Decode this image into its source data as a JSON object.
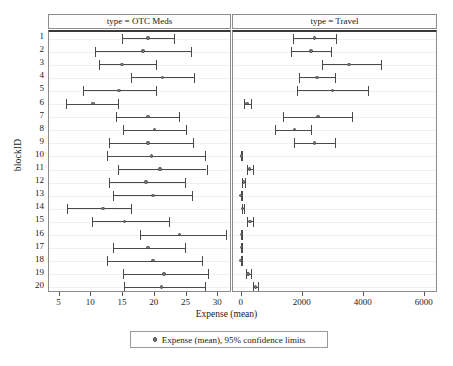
{
  "chart_data": {
    "type": "scatter",
    "title": "",
    "xlabel": "Expense (mean)",
    "ylabel": "blockID",
    "grid": true,
    "legend_position": "bottom",
    "legend_entries": [
      "Expense (mean), 95% confidence limits"
    ],
    "categories": [
      "1",
      "2",
      "3",
      "4",
      "5",
      "6",
      "7",
      "8",
      "9",
      "10",
      "11",
      "12",
      "13",
      "14",
      "15",
      "16",
      "17",
      "18",
      "19",
      "20"
    ],
    "panels": [
      {
        "label": "type = OTC Meds",
        "xlim": [
          3.5,
          32.0
        ],
        "xticks": [
          5,
          10,
          15,
          20,
          25,
          30
        ],
        "series": [
          {
            "name": "Expense (mean), 95% confidence limits",
            "points": [
              {
                "category": "1",
                "mean": 19.1,
                "lower": 15.0,
                "upper": 23.2
              },
              {
                "category": "2",
                "mean": 18.3,
                "lower": 10.8,
                "upper": 25.9
              },
              {
                "category": "3",
                "mean": 15.0,
                "lower": 11.4,
                "upper": 20.3
              },
              {
                "category": "4",
                "mean": 21.4,
                "lower": 16.4,
                "upper": 26.3
              },
              {
                "category": "5",
                "mean": 14.5,
                "lower": 8.9,
                "upper": 20.4
              },
              {
                "category": "6",
                "mean": 10.4,
                "lower": 6.1,
                "upper": 14.4
              },
              {
                "category": "7",
                "mean": 19.1,
                "lower": 14.1,
                "upper": 24.0
              },
              {
                "category": "8",
                "mean": 20.1,
                "lower": 15.2,
                "upper": 25.0
              },
              {
                "category": "9",
                "mean": 19.1,
                "lower": 12.9,
                "upper": 26.2
              },
              {
                "category": "10",
                "mean": 19.6,
                "lower": 12.7,
                "upper": 28.0
              },
              {
                "category": "11",
                "mean": 21.0,
                "lower": 14.4,
                "upper": 28.3
              },
              {
                "category": "12",
                "mean": 18.8,
                "lower": 12.9,
                "upper": 24.9
              },
              {
                "category": "13",
                "mean": 19.9,
                "lower": 13.6,
                "upper": 26.0
              },
              {
                "category": "14",
                "mean": 12.0,
                "lower": 6.3,
                "upper": 16.4
              },
              {
                "category": "15",
                "mean": 15.4,
                "lower": 10.3,
                "upper": 22.4
              },
              {
                "category": "16",
                "mean": 24.0,
                "lower": 17.9,
                "upper": 31.4
              },
              {
                "category": "17",
                "mean": 19.1,
                "lower": 13.6,
                "upper": 24.9
              },
              {
                "category": "18",
                "mean": 19.9,
                "lower": 12.7,
                "upper": 27.6
              },
              {
                "category": "19",
                "mean": 21.6,
                "lower": 15.1,
                "upper": 28.6
              },
              {
                "category": "20",
                "mean": 21.2,
                "lower": 15.3,
                "upper": 28.0
              }
            ]
          }
        ]
      },
      {
        "label": "type = Travel",
        "xlim": [
          -250,
          6400
        ],
        "xticks": [
          0,
          2000,
          4000,
          6000
        ],
        "series": [
          {
            "name": "Expense (mean), 95% confidence limits",
            "points": [
              {
                "category": "1",
                "mean": 2420,
                "lower": 1700,
                "upper": 3110
              },
              {
                "category": "2",
                "mean": 2310,
                "lower": 1640,
                "upper": 2970
              },
              {
                "category": "3",
                "mean": 3550,
                "lower": 2680,
                "upper": 4590
              },
              {
                "category": "4",
                "mean": 2500,
                "lower": 1910,
                "upper": 3080
              },
              {
                "category": "5",
                "mean": 3000,
                "lower": 1860,
                "upper": 4180
              },
              {
                "category": "6",
                "mean": 210,
                "lower": 100,
                "upper": 330
              },
              {
                "category": "7",
                "mean": 2540,
                "lower": 1390,
                "upper": 3660
              },
              {
                "category": "8",
                "mean": 1760,
                "lower": 1110,
                "upper": 2300
              },
              {
                "category": "9",
                "mean": 2420,
                "lower": 1740,
                "upper": 3090
              },
              {
                "category": "10",
                "mean": 25,
                "lower": 10,
                "upper": 45
              },
              {
                "category": "11",
                "mean": 300,
                "lower": 215,
                "upper": 390
              },
              {
                "category": "12",
                "mean": 90,
                "lower": 55,
                "upper": 130
              },
              {
                "category": "13",
                "mean": 10,
                "lower": 0,
                "upper": 30
              },
              {
                "category": "14",
                "mean": 65,
                "lower": 40,
                "upper": 95
              },
              {
                "category": "15",
                "mean": 310,
                "lower": 205,
                "upper": 420
              },
              {
                "category": "16",
                "mean": 20,
                "lower": 0,
                "upper": 45
              },
              {
                "category": "17",
                "mean": 25,
                "lower": 0,
                "upper": 55
              },
              {
                "category": "18",
                "mean": 15,
                "lower": 0,
                "upper": 40
              },
              {
                "category": "19",
                "mean": 245,
                "lower": 175,
                "upper": 330
              },
              {
                "category": "20",
                "mean": 480,
                "lower": 390,
                "upper": 570
              }
            ]
          }
        ]
      }
    ]
  },
  "colors": {
    "line": "#4a4a4a",
    "marker_fill": "#7a7a7a",
    "panel_border": "#8d8d8d",
    "panel_top_border": "#3a3a3a",
    "gridline": "#f0f0f0",
    "text": "#1a1a1a",
    "background": "#ffffff"
  }
}
